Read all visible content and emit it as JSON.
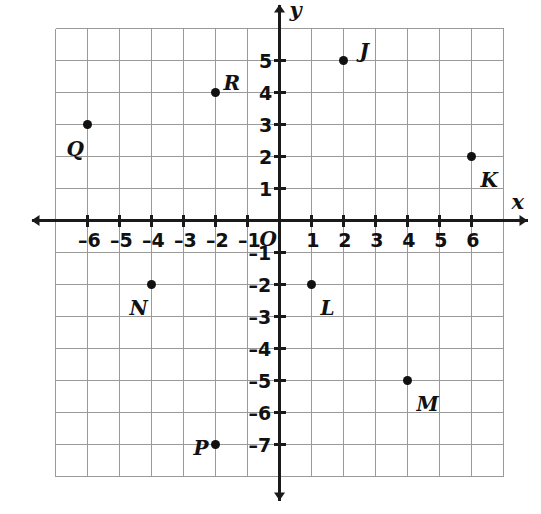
{
  "figure": {
    "kind": "coordinate-plane",
    "background_color": "#ffffff",
    "grid_color": "#9a9a9a",
    "axis_color": "#1a1a1a",
    "point_color": "#111111",
    "origin_label": "O",
    "x_axis_label": "x",
    "y_axis_label": "y"
  },
  "chart_data": {
    "type": "scatter",
    "title": "",
    "xlabel": "x",
    "ylabel": "y",
    "xlim": [
      -7,
      7
    ],
    "ylim": [
      -8,
      6
    ],
    "grid": true,
    "legend": "none",
    "origin_label": "O",
    "x_ticks": [
      -6,
      -5,
      -4,
      -3,
      -2,
      -1,
      1,
      2,
      3,
      4,
      5,
      6
    ],
    "x_tick_labels": [
      "–6",
      "–5",
      "–4",
      "–3",
      "–2",
      "–1",
      "1",
      "2",
      "3",
      "4",
      "5",
      "6"
    ],
    "y_ticks": [
      5,
      4,
      3,
      2,
      1,
      -1,
      -2,
      -3,
      -4,
      -5,
      -6,
      -7
    ],
    "y_tick_labels": [
      "5",
      "4",
      "3",
      "2",
      "1",
      "–1",
      "–2",
      "–3",
      "–4",
      "–5",
      "–6",
      "–7"
    ],
    "points": [
      {
        "label": "J",
        "x": 2,
        "y": 5,
        "label_dx": 16,
        "label_dy": -20
      },
      {
        "label": "K",
        "x": 6,
        "y": 2,
        "label_dx": 9,
        "label_dy": 13
      },
      {
        "label": "L",
        "x": 1,
        "y": -2,
        "label_dx": 9,
        "label_dy": 13
      },
      {
        "label": "M",
        "x": 4,
        "y": -5,
        "label_dx": 9,
        "label_dy": 13
      },
      {
        "label": "N",
        "x": -4,
        "y": -2,
        "label_dx": -22,
        "label_dy": 13
      },
      {
        "label": "P",
        "x": -2,
        "y": -7,
        "label_dx": -22,
        "label_dy": -7
      },
      {
        "label": "Q",
        "x": -6,
        "y": 3,
        "label_dx": -21,
        "label_dy": 14
      },
      {
        "label": "R",
        "x": -2,
        "y": 4,
        "label_dx": 8,
        "label_dy": -20
      }
    ]
  }
}
